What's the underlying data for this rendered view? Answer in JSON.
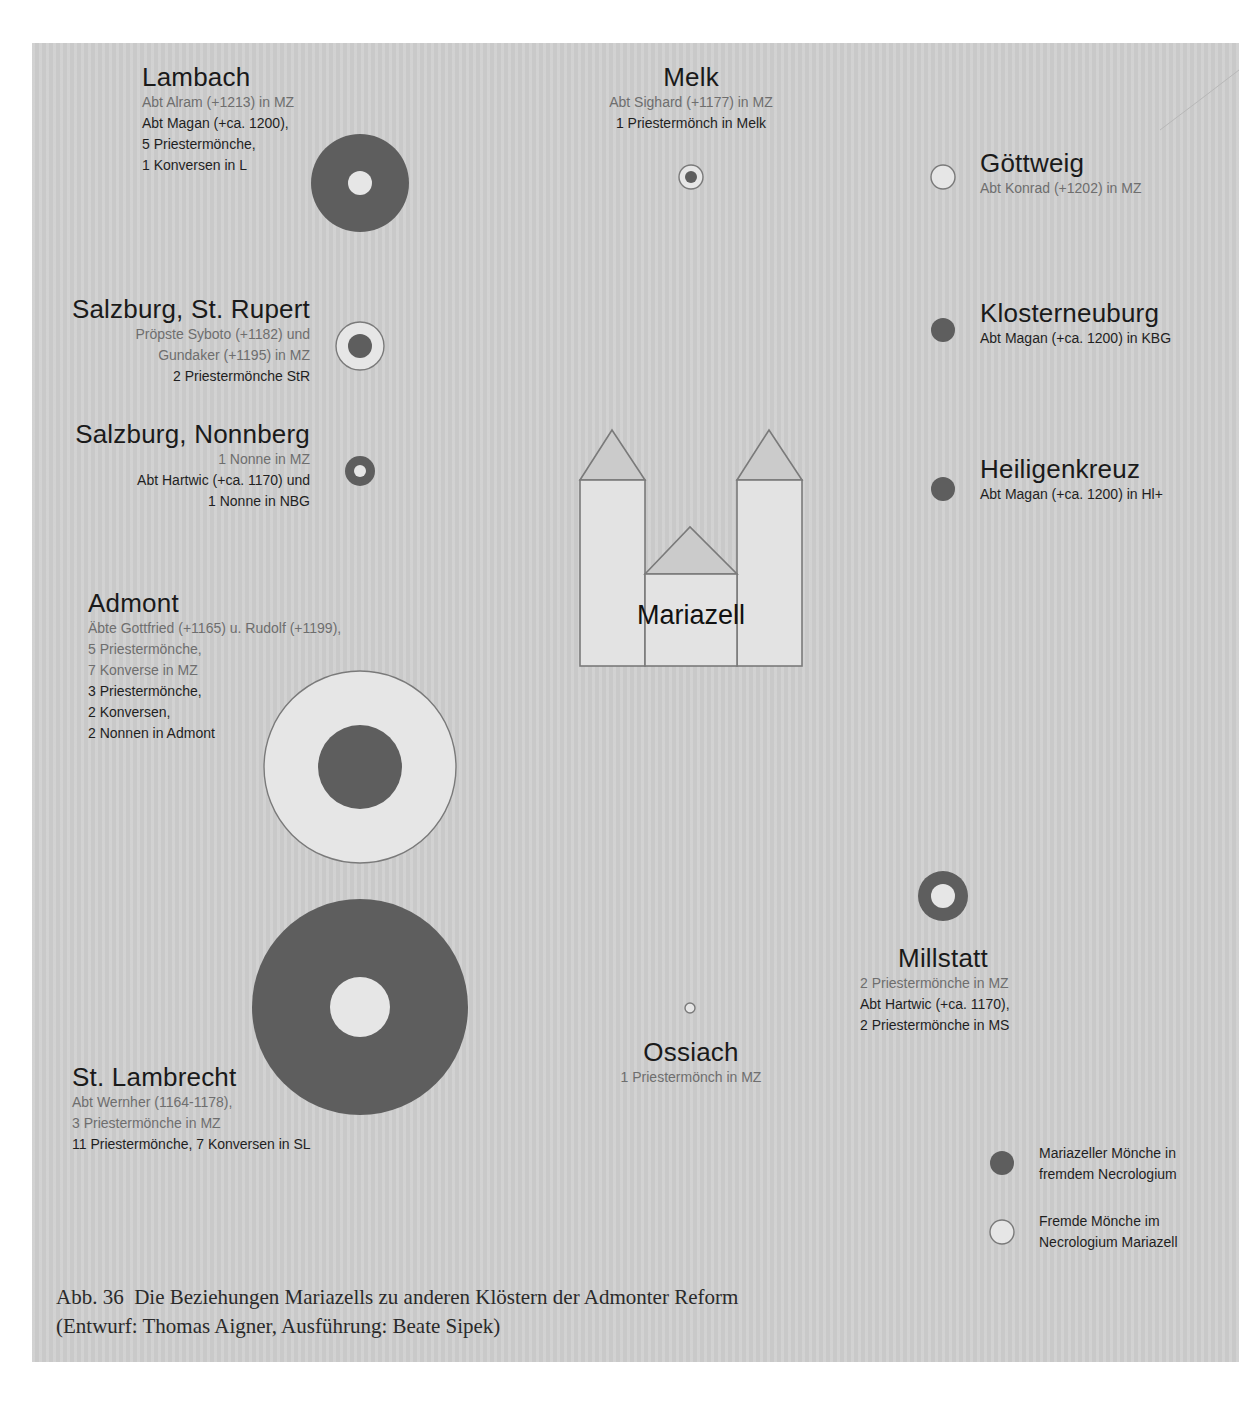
{
  "colors": {
    "panel_bg": "#cfcfcf",
    "dark_fill": "#5e5e5e",
    "light_fill": "#e6e6e6",
    "outline": "#7a7a7a",
    "text_mz": "#6e6e6e",
    "text_own": "#1f1f1f"
  },
  "center": {
    "name": "Mariazell",
    "icon": "church-icon"
  },
  "monasteries": [
    {
      "id": "lambach",
      "name": "Lambach",
      "mz_lines": [
        "Abt Alram (+1213) in MZ"
      ],
      "own_lines": [
        "Abt Magan (+ca. 1200),",
        "5 Priestermönche,",
        "1 Konversen in L"
      ],
      "marker": {
        "cx": 360,
        "cy": 183,
        "outer_r": 49,
        "outer": "dark",
        "inner_r": 12,
        "inner": "light"
      }
    },
    {
      "id": "melk",
      "name": "Melk",
      "mz_lines": [
        "Abt Sighard (+1177) in MZ"
      ],
      "own_lines": [
        "1 Priestermönch in Melk"
      ],
      "marker": {
        "cx": 691,
        "cy": 177,
        "outer_r": 12,
        "outer": "light",
        "inner_r": 6,
        "inner": "dark"
      }
    },
    {
      "id": "goettweig",
      "name": "Göttweig",
      "mz_lines": [
        "Abt Konrad (+1202) in MZ"
      ],
      "own_lines": [],
      "marker": {
        "cx": 943,
        "cy": 177,
        "outer_r": 12,
        "outer": "light",
        "inner_r": 0,
        "inner": "none"
      }
    },
    {
      "id": "salzburg-st-rupert",
      "name": "Salzburg, St. Rupert",
      "mz_lines": [
        "Pröpste Syboto (+1182) und",
        "Gundaker (+1195) in MZ"
      ],
      "own_lines": [
        "2 Priestermönche StR"
      ],
      "marker": {
        "cx": 360,
        "cy": 346,
        "outer_r": 24,
        "outer": "light",
        "inner_r": 12,
        "inner": "dark"
      }
    },
    {
      "id": "klosterneuburg",
      "name": "Klosterneuburg",
      "mz_lines": [],
      "own_lines": [
        "Abt Magan (+ca. 1200) in KBG"
      ],
      "marker": {
        "cx": 943,
        "cy": 330,
        "outer_r": 12,
        "outer": "dark",
        "inner_r": 0,
        "inner": "none"
      }
    },
    {
      "id": "salzburg-nonnberg",
      "name": "Salzburg, Nonnberg",
      "mz_lines": [
        "1 Nonne in MZ"
      ],
      "own_lines": [
        "Abt Hartwic (+ca. 1170) und",
        "1 Nonne in NBG"
      ],
      "marker": {
        "cx": 360,
        "cy": 471,
        "outer_r": 15,
        "outer": "dark",
        "inner_r": 6,
        "inner": "light"
      }
    },
    {
      "id": "heiligenkreuz",
      "name": "Heiligenkreuz",
      "mz_lines": [],
      "own_lines": [
        "Abt Magan (+ca. 1200) in Hl+"
      ],
      "marker": {
        "cx": 943,
        "cy": 489,
        "outer_r": 12,
        "outer": "dark",
        "inner_r": 0,
        "inner": "none"
      }
    },
    {
      "id": "admont",
      "name": "Admont",
      "mz_lines": [
        "Äbte Gottfried (+1165) u. Rudolf (+1199),",
        "5 Priestermönche,",
        "7 Konverse in MZ"
      ],
      "own_lines": [
        "3 Priestermönche,",
        "2 Konversen,",
        "2 Nonnen in Admont"
      ],
      "marker": {
        "cx": 360,
        "cy": 767,
        "outer_r": 96,
        "outer": "light",
        "inner_r": 42,
        "inner": "dark"
      }
    },
    {
      "id": "millstatt",
      "name": "Millstatt",
      "mz_lines": [
        "2 Priestermönche in MZ"
      ],
      "own_lines": [
        "Abt Hartwic (+ca. 1170),",
        "2 Priestermönche in MS"
      ],
      "marker": {
        "cx": 943,
        "cy": 896,
        "outer_r": 25,
        "outer": "dark",
        "inner_r": 12,
        "inner": "light"
      }
    },
    {
      "id": "st-lambrecht",
      "name": "St. Lambrecht",
      "mz_lines": [
        "Abt Wernher (1164-1178),",
        "3 Priestermönche in MZ"
      ],
      "own_lines": [
        "11 Priestermönche, 7 Konversen in SL"
      ],
      "marker": {
        "cx": 360,
        "cy": 1007,
        "outer_r": 108,
        "outer": "dark",
        "inner_r": 30,
        "inner": "light"
      }
    },
    {
      "id": "ossiach",
      "name": "Ossiach",
      "mz_lines": [
        "1 Priestermönch in MZ"
      ],
      "own_lines": [],
      "marker": {
        "cx": 690,
        "cy": 1008,
        "outer_r": 5,
        "outer": "light",
        "inner_r": 0,
        "inner": "none"
      }
    }
  ],
  "legend": {
    "items": [
      {
        "swatch": "dark",
        "icon": "filled-circle-icon",
        "lines": [
          "Mariazeller Mönche in",
          "fremdem Necrologium"
        ]
      },
      {
        "swatch": "light",
        "icon": "open-circle-icon",
        "lines": [
          "Fremde Mönche im",
          "Necrologium Mariazell"
        ]
      }
    ]
  },
  "caption": {
    "line1": "Abb. 36  Die Beziehungen Mariazells zu anderen Klöstern der Admonter Reform",
    "line2": "(Entwurf: Thomas Aigner, Ausführung: Beate Sipek)"
  }
}
